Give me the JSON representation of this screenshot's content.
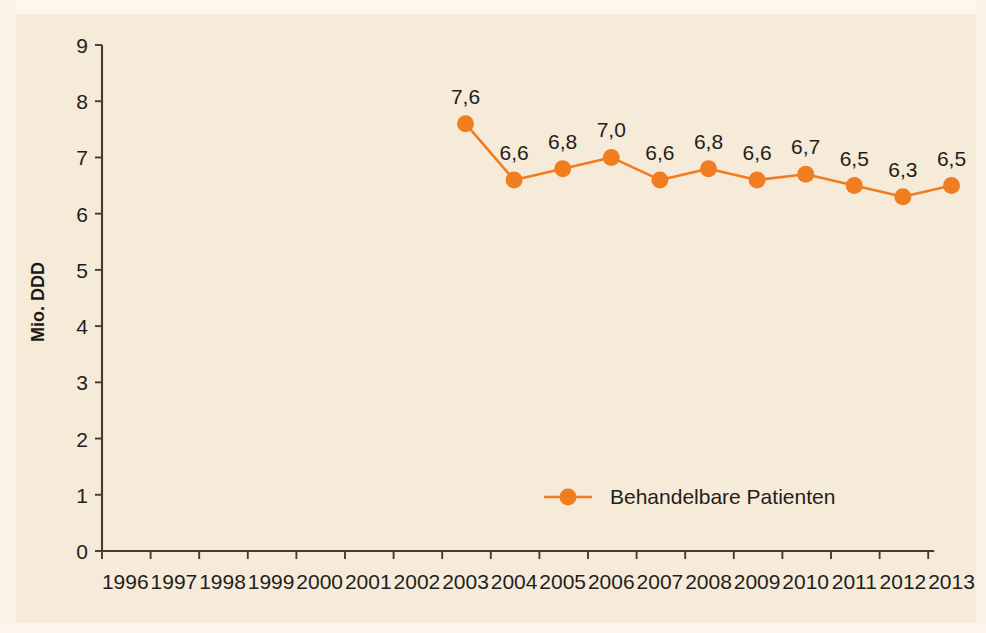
{
  "colors": {
    "background": "#f6ead9",
    "page_background": "#f7ecde",
    "series_orange": "#f07d20",
    "axis": "#4a3a2e",
    "text": "#231e1b"
  },
  "axis": {
    "y_title": "Mio. DDD",
    "y_ticks": [
      "0",
      "1",
      "2",
      "3",
      "4",
      "5",
      "6",
      "7",
      "8",
      "9"
    ],
    "x_ticks": [
      "1996",
      "1997",
      "1998",
      "1999",
      "2000",
      "2001",
      "2002",
      "2003",
      "2004",
      "2005",
      "2006",
      "2007",
      "2008",
      "2009",
      "2010",
      "2011",
      "2012",
      "2013"
    ]
  },
  "legend": {
    "items": [
      {
        "label": "Behandelbare Patienten",
        "color": "#f07d20",
        "marker": "circle"
      }
    ]
  },
  "chart_data": {
    "type": "line",
    "title": "",
    "xlabel": "",
    "ylabel": "Mio. DDD",
    "categories": [
      "1996",
      "1997",
      "1998",
      "1999",
      "2000",
      "2001",
      "2002",
      "2003",
      "2004",
      "2005",
      "2006",
      "2007",
      "2008",
      "2009",
      "2010",
      "2011",
      "2012",
      "2013"
    ],
    "series": [
      {
        "name": "Behandelbare Patienten",
        "color": "#f07d20",
        "values": [
          null,
          null,
          null,
          null,
          null,
          null,
          null,
          7.6,
          6.6,
          6.8,
          7.0,
          6.6,
          6.8,
          6.6,
          6.7,
          6.5,
          6.3,
          6.5
        ],
        "data_labels": [
          "",
          "",
          "",
          "",
          "",
          "",
          "",
          "7,6",
          "6,6",
          "6,8",
          "7,0",
          "6,6",
          "6,8",
          "6,6",
          "6,7",
          "6,5",
          "6,3",
          "6,5"
        ]
      }
    ],
    "ylim": [
      0,
      9
    ],
    "ytick_step": 1,
    "grid": false,
    "legend_position": "inside-bottom-center",
    "decimal_separator": ","
  }
}
